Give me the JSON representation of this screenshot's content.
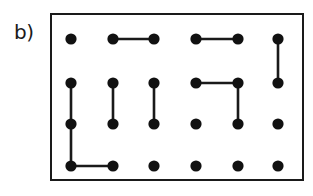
{
  "figure": {
    "panel_label": "b)",
    "type": "dimer-covering-lattice-diagram",
    "colors": {
      "ink": "#1a1a1a",
      "site_fill": "#111111",
      "background": "#ffffff"
    },
    "frame": {
      "x": 51,
      "y": 14,
      "width": 252,
      "height": 166
    },
    "lattice": {
      "columns": 6,
      "rows": 4,
      "column_x": [
        71,
        113,
        154,
        196,
        238,
        278
      ],
      "row_y": [
        39,
        83,
        124,
        166
      ],
      "site_radius": 5.6,
      "site_count": 24
    },
    "sites": [
      {
        "id": "r1c1",
        "row": 1,
        "col": 1
      },
      {
        "id": "r1c2",
        "row": 1,
        "col": 2
      },
      {
        "id": "r1c3",
        "row": 1,
        "col": 3
      },
      {
        "id": "r1c4",
        "row": 1,
        "col": 4
      },
      {
        "id": "r1c5",
        "row": 1,
        "col": 5
      },
      {
        "id": "r1c6",
        "row": 1,
        "col": 6
      },
      {
        "id": "r2c1",
        "row": 2,
        "col": 1
      },
      {
        "id": "r2c2",
        "row": 2,
        "col": 2
      },
      {
        "id": "r2c3",
        "row": 2,
        "col": 3
      },
      {
        "id": "r2c4",
        "row": 2,
        "col": 4
      },
      {
        "id": "r2c5",
        "row": 2,
        "col": 5
      },
      {
        "id": "r2c6",
        "row": 2,
        "col": 6
      },
      {
        "id": "r3c1",
        "row": 3,
        "col": 1
      },
      {
        "id": "r3c2",
        "row": 3,
        "col": 2
      },
      {
        "id": "r3c3",
        "row": 3,
        "col": 3
      },
      {
        "id": "r3c4",
        "row": 3,
        "col": 4
      },
      {
        "id": "r3c5",
        "row": 3,
        "col": 5
      },
      {
        "id": "r3c6",
        "row": 3,
        "col": 6
      },
      {
        "id": "r4c1",
        "row": 4,
        "col": 1
      },
      {
        "id": "r4c2",
        "row": 4,
        "col": 2
      },
      {
        "id": "r4c3",
        "row": 4,
        "col": 3
      },
      {
        "id": "r4c4",
        "row": 4,
        "col": 4
      },
      {
        "id": "r4c5",
        "row": 4,
        "col": 5
      },
      {
        "id": "r4c6",
        "row": 4,
        "col": 6
      }
    ],
    "edges": [
      {
        "id": "e1",
        "from": "r1c2",
        "to": "r1c3",
        "orientation": "horizontal"
      },
      {
        "id": "e2",
        "from": "r1c4",
        "to": "r1c5",
        "orientation": "horizontal"
      },
      {
        "id": "e3",
        "from": "r1c6",
        "to": "r2c6",
        "orientation": "vertical"
      },
      {
        "id": "e4",
        "from": "r2c1",
        "to": "r3c1",
        "orientation": "vertical"
      },
      {
        "id": "e5",
        "from": "r2c2",
        "to": "r3c2",
        "orientation": "vertical"
      },
      {
        "id": "e6",
        "from": "r2c3",
        "to": "r3c3",
        "orientation": "vertical"
      },
      {
        "id": "e7",
        "from": "r2c4",
        "to": "r2c5",
        "orientation": "horizontal"
      },
      {
        "id": "e8",
        "from": "r2c5",
        "to": "r3c5",
        "orientation": "vertical"
      },
      {
        "id": "e9",
        "from": "r3c1",
        "to": "r4c1",
        "orientation": "vertical"
      },
      {
        "id": "e10",
        "from": "r4c1",
        "to": "r4c2",
        "orientation": "horizontal"
      }
    ]
  }
}
